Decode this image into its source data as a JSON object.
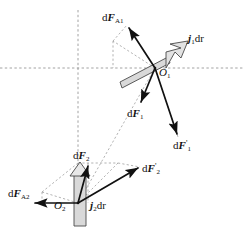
{
  "figure": {
    "width": 244,
    "height": 238,
    "background": "#ffffff",
    "stroke_color": "#111111",
    "dashed_color": "#8a8a8a",
    "element_fill": "#d9d9d9"
  },
  "axes": {
    "horizontal": {
      "y": 68,
      "x_start": 0,
      "x_end": 244,
      "style": "dashed"
    },
    "vertical": {
      "x": 78,
      "y_start": 10,
      "y_end": 196,
      "style": "dashed"
    }
  },
  "labels": {
    "dF_A1": {
      "base": "d",
      "symbol": "F",
      "sub": "A1",
      "prime": "",
      "x": 104,
      "y": 16
    },
    "j1dr": {
      "base": "",
      "symbol": "j",
      "sub": "1",
      "tail": "dr",
      "x": 190,
      "y": 38
    },
    "O1": {
      "symbol": "O",
      "sub": "1",
      "x": 161,
      "y": 72
    },
    "dF_1": {
      "base": "d",
      "symbol": "F",
      "sub": "1",
      "prime": "",
      "x": 128,
      "y": 113
    },
    "dF_1_prime": {
      "base": "d",
      "symbol": "F",
      "sub": "1",
      "prime": "'",
      "x": 176,
      "y": 145
    },
    "dF_2": {
      "base": "d",
      "symbol": "F",
      "sub": "2",
      "prime": "",
      "x": 75,
      "y": 155
    },
    "dF_2_prime": {
      "base": "d",
      "symbol": "F",
      "sub": "2",
      "prime": "'",
      "x": 144,
      "y": 168
    },
    "dF_A2": {
      "base": "d",
      "symbol": "F",
      "sub": "A2",
      "prime": "",
      "x": 10,
      "y": 193
    },
    "O2": {
      "symbol": "O",
      "sub": "2",
      "x": 56,
      "y": 205
    },
    "j2dr": {
      "base": "",
      "symbol": "j",
      "sub": "2",
      "tail": "dr",
      "x": 86,
      "y": 205
    }
  },
  "vectors": [
    {
      "name": "dF_A1",
      "from": [
        155,
        68
      ],
      "to": [
        127,
        25
      ],
      "style": "solid"
    },
    {
      "name": "dF_1",
      "from": [
        155,
        68
      ],
      "to": [
        140,
        105
      ],
      "style": "solid"
    },
    {
      "name": "dF_1_prime",
      "from": [
        155,
        68
      ],
      "to": [
        178,
        137
      ],
      "style": "solid"
    },
    {
      "name": "dF_2",
      "from": [
        78,
        203
      ],
      "to": [
        88,
        163
      ],
      "style": "solid"
    },
    {
      "name": "dF_2_prime",
      "from": [
        78,
        203
      ],
      "to": [
        140,
        167
      ],
      "style": "solid"
    },
    {
      "name": "dF_A2",
      "from": [
        78,
        203
      ],
      "to": [
        32,
        203
      ],
      "style": "solid"
    }
  ],
  "construction_lines": [
    {
      "name": "parallelogram-upper-left",
      "from": [
        155,
        68
      ],
      "to": [
        113,
        41
      ]
    },
    {
      "name": "parallelogram-upper-right",
      "from": [
        113,
        41
      ],
      "to": [
        127,
        25
      ]
    },
    {
      "name": "connector-O1-O2",
      "from": [
        155,
        68
      ],
      "to": [
        78,
        203
      ]
    },
    {
      "name": "parallelogram-lower-top",
      "from": [
        78,
        163
      ],
      "to": [
        118,
        163
      ]
    },
    {
      "name": "parallelogram-lower-left",
      "from": [
        78,
        163
      ],
      "to": [
        42,
        192
      ]
    },
    {
      "name": "parallelogram-lower-diag",
      "from": [
        42,
        192
      ],
      "to": [
        78,
        203
      ]
    },
    {
      "name": "parallelogram-lower-right",
      "from": [
        118,
        163
      ],
      "to": [
        140,
        167
      ]
    }
  ],
  "current_elements": [
    {
      "name": "element-1",
      "origin": [
        155,
        68
      ],
      "angle_deg": -28,
      "length": 62,
      "label": "j1dr"
    },
    {
      "name": "element-2",
      "origin": [
        78,
        203
      ],
      "angle_deg": -90,
      "length": 54,
      "label": "j2dr"
    }
  ]
}
